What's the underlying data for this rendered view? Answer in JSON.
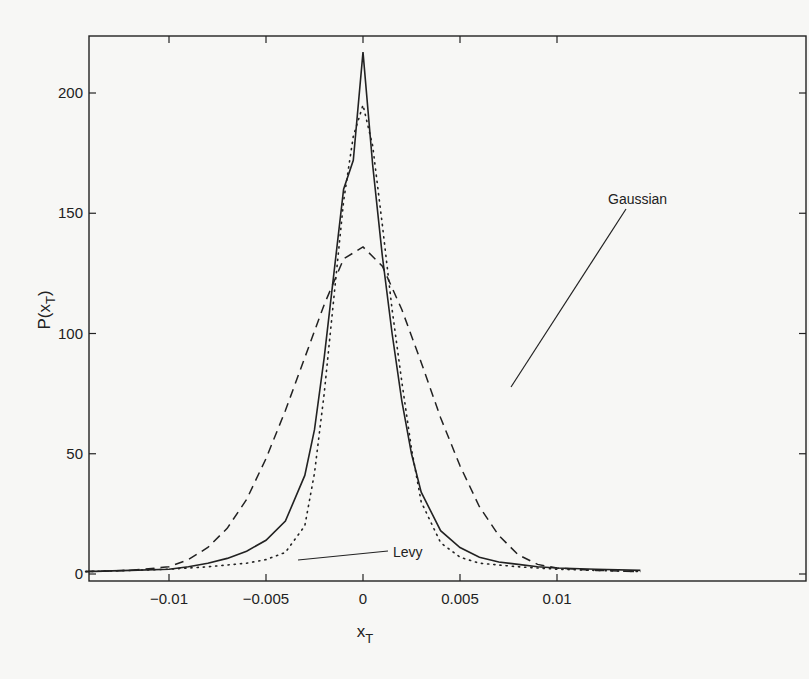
{
  "chart_data": {
    "type": "line",
    "title": "",
    "xlabel": "x_T",
    "ylabel": "P(x_T)",
    "xlim": [
      -0.0145,
      0.0145
    ],
    "ylim": [
      -3,
      225
    ],
    "grid": false,
    "legend_position": "inline annotations",
    "x_ticks": [
      -0.01,
      -0.005,
      0,
      0.005,
      0.01
    ],
    "x_tick_labels": [
      "-0.01",
      "-0.005",
      "0",
      "0.005",
      "0.01"
    ],
    "y_ticks": [
      0,
      50,
      100,
      150,
      200
    ],
    "y_tick_labels": [
      "0",
      "50",
      "100",
      "150",
      "200"
    ],
    "annotations": [
      {
        "text": "Gaussian",
        "points_to": "dashed curve right flank near x=0.0037, y~75"
      },
      {
        "text": "Levy",
        "points_to": "dotted curve left flank near x=-0.0035, y~12"
      }
    ],
    "series": [
      {
        "name": "Empirical",
        "style": "solid",
        "x": [
          -0.0145,
          -0.012,
          -0.01,
          -0.009,
          -0.008,
          -0.007,
          -0.006,
          -0.005,
          -0.004,
          -0.003,
          -0.0025,
          -0.002,
          -0.0015,
          -0.001,
          -0.0005,
          0,
          0.0005,
          0.001,
          0.0015,
          0.002,
          0.0025,
          0.003,
          0.004,
          0.005,
          0.006,
          0.007,
          0.008,
          0.009,
          0.01,
          0.012,
          0.0145
        ],
        "values": [
          1,
          1.5,
          2,
          3,
          4.5,
          6.5,
          9.5,
          14,
          22,
          41,
          60,
          90,
          125,
          160,
          172,
          217,
          170,
          132,
          100,
          72,
          50,
          34,
          18,
          11,
          7,
          5,
          4,
          3,
          2.5,
          2,
          1.5
        ]
      },
      {
        "name": "Gaussian",
        "style": "dashed",
        "x": [
          -0.0145,
          -0.012,
          -0.01,
          -0.009,
          -0.008,
          -0.007,
          -0.006,
          -0.005,
          -0.004,
          -0.003,
          -0.002,
          -0.001,
          0,
          0.001,
          0.002,
          0.003,
          0.004,
          0.005,
          0.006,
          0.007,
          0.008,
          0.009,
          0.01,
          0.012,
          0.0145
        ],
        "values": [
          1,
          1.5,
          3,
          6,
          11,
          19,
          31,
          48,
          68,
          90,
          112,
          131,
          136,
          128,
          110,
          88,
          65,
          45,
          28,
          16,
          8,
          4,
          2.5,
          1.5,
          1
        ]
      },
      {
        "name": "Levy",
        "style": "dotted",
        "x": [
          -0.0145,
          -0.012,
          -0.01,
          -0.008,
          -0.006,
          -0.005,
          -0.004,
          -0.003,
          -0.0025,
          -0.002,
          -0.0015,
          -0.001,
          -0.0005,
          0,
          0.0005,
          0.001,
          0.0015,
          0.002,
          0.0025,
          0.003,
          0.004,
          0.005,
          0.006,
          0.008,
          0.01,
          0.012,
          0.0145
        ],
        "values": [
          1,
          1.5,
          2,
          3,
          4.5,
          6,
          9,
          20,
          42,
          75,
          115,
          155,
          182,
          195,
          178,
          145,
          110,
          80,
          52,
          30,
          13,
          7,
          4.5,
          3,
          2,
          1.5,
          1
        ]
      }
    ]
  },
  "figure": {
    "x_axis_title_main": "x",
    "x_axis_title_sub": "T",
    "y_axis_title_main": "P(x",
    "y_axis_title_sub": "T",
    "y_axis_title_close": ")",
    "annotation_gaussian": "Gaussian",
    "annotation_levy": "Levy",
    "colors": {
      "line": "#222222",
      "axis": "#222222",
      "background": "#f7f7f5"
    }
  }
}
